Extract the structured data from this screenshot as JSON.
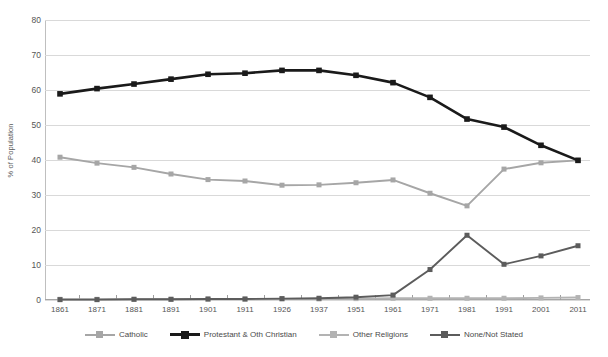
{
  "chart_data": {
    "type": "line",
    "title": "",
    "xlabel": "",
    "ylabel": "% of Population",
    "ylim": [
      0,
      80
    ],
    "ytick_step": 10,
    "grid": true,
    "legend_position": "bottom",
    "categories": [
      "1861",
      "1871",
      "1881",
      "1891",
      "1901",
      "1911",
      "1926",
      "1937",
      "1951",
      "1961",
      "1971",
      "1981",
      "1991",
      "2001",
      "2011"
    ],
    "series": [
      {
        "name": "Catholic",
        "color": "#a6a6a6",
        "marker": "square",
        "values": [
          40.8,
          39.1,
          37.9,
          36.0,
          34.4,
          34.0,
          32.8,
          32.9,
          33.5,
          34.3,
          30.5,
          26.9,
          37.4,
          39.2,
          39.9
        ]
      },
      {
        "name": "Protestant & Oth Christian",
        "color": "#1a1a1a",
        "marker": "square",
        "values": [
          58.9,
          60.4,
          61.7,
          63.1,
          64.5,
          64.8,
          65.6,
          65.6,
          64.2,
          62.1,
          57.9,
          51.7,
          49.4,
          44.2,
          39.9
        ]
      },
      {
        "name": "Other Religions",
        "color": "#b3b3b3",
        "marker": "square",
        "values": [
          0.2,
          0.2,
          0.2,
          0.2,
          0.2,
          0.2,
          0.3,
          0.3,
          0.4,
          0.5,
          0.5,
          0.5,
          0.5,
          0.6,
          0.7
        ]
      },
      {
        "name": "None/Not Stated",
        "color": "#5c5c5c",
        "marker": "square",
        "values": [
          0.1,
          0.1,
          0.2,
          0.2,
          0.3,
          0.3,
          0.4,
          0.5,
          0.8,
          1.4,
          8.7,
          18.5,
          10.2,
          12.6,
          15.5
        ]
      }
    ]
  },
  "axis": {
    "y_ticks": [
      "0",
      "10",
      "20",
      "30",
      "40",
      "50",
      "60",
      "70",
      "80"
    ],
    "y_label": "% of Population"
  },
  "legend": {
    "items": [
      {
        "label": "Catholic"
      },
      {
        "label": "Protestant & Oth Christian"
      },
      {
        "label": "Other Religions"
      },
      {
        "label": "None/Not Stated"
      }
    ]
  }
}
